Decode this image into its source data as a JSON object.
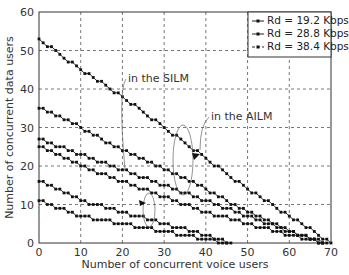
{
  "chart_data": {
    "type": "line",
    "title": "",
    "xlabel": "Number of concurrent voice users",
    "ylabel": "Number of concurrent data users",
    "xlim": [
      0,
      70
    ],
    "ylim": [
      0,
      60
    ],
    "xticks": [
      0,
      10,
      20,
      30,
      40,
      50,
      60,
      70
    ],
    "yticks": [
      0,
      10,
      20,
      30,
      40,
      50,
      60
    ],
    "grid": true,
    "legend_position": "upper right",
    "legend": [
      "R_d = 19.2 Kbps",
      "R_d = 28.8 Kbps",
      "R_d = 38.4 Kbps"
    ],
    "annotations": [
      "in the SILM",
      "in the AILM"
    ],
    "series": [
      {
        "name": "R_d = 19.2 Kbps (AILM)",
        "x": [
          0,
          10,
          20,
          30,
          40,
          50,
          60,
          70
        ],
        "y": [
          53,
          45,
          38,
          30,
          22,
          14,
          7,
          0
        ]
      },
      {
        "name": "R_d = 19.2 Kbps (SILM)",
        "x": [
          0,
          10,
          20,
          30,
          40,
          50,
          60,
          68
        ],
        "y": [
          35,
          30,
          24,
          19,
          14,
          8,
          3,
          0
        ]
      },
      {
        "name": "R_d = 28.8 Kbps (AILM)",
        "x": [
          0,
          10,
          20,
          30,
          40,
          50,
          60,
          69
        ],
        "y": [
          27,
          23,
          19,
          15,
          11,
          7,
          3,
          0
        ]
      },
      {
        "name": "R_d = 28.8 Kbps (SILM)",
        "x": [
          0,
          10,
          20,
          30,
          40,
          50,
          60,
          68
        ],
        "y": [
          25,
          20,
          16,
          12,
          8,
          5,
          2,
          0
        ]
      },
      {
        "name": "R_d = 38.4 Kbps (AILM)",
        "x": [
          0,
          10,
          20,
          30,
          40,
          46
        ],
        "y": [
          16,
          11,
          8,
          5,
          2,
          0
        ]
      },
      {
        "name": "R_d = 38.4 Kbps (SILM)",
        "x": [
          0,
          10,
          20,
          30,
          40,
          45
        ],
        "y": [
          11,
          7,
          5,
          3,
          1,
          0
        ]
      }
    ]
  }
}
